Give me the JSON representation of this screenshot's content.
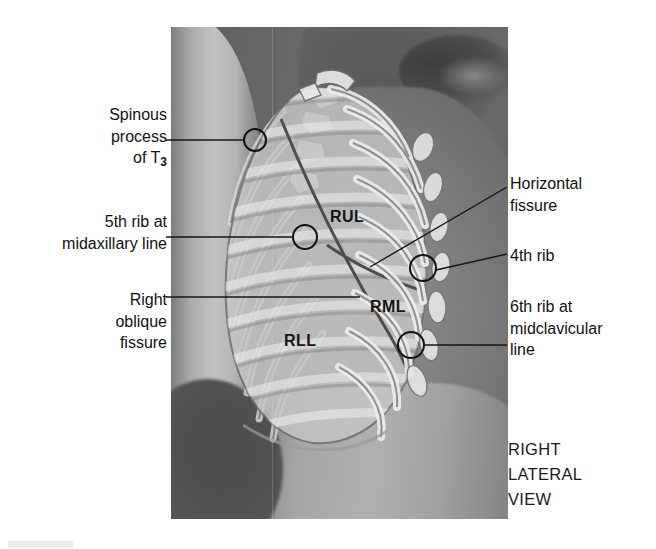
{
  "figure": {
    "view_caption": [
      "RIGHT",
      "LATERAL",
      "VIEW"
    ],
    "colors": {
      "label_text": "#111111",
      "leader_line": "#1a1a1a",
      "marker_circle": "#111111",
      "lung_overlay": "#c8c8c8",
      "rib_overlay": "#e2e2e2",
      "plate_background": "#6e6e6e"
    }
  },
  "lobes": [
    {
      "id": "rul",
      "label": "RUL",
      "name": "right upper lobe"
    },
    {
      "id": "rml",
      "label": "RML",
      "name": "right middle lobe"
    },
    {
      "id": "rll",
      "label": "RLL",
      "name": "right lower lobe"
    }
  ],
  "callouts": {
    "spinous_process": {
      "lines": [
        "Spinous",
        "process",
        "of T"
      ],
      "subscript": "3",
      "side": "left"
    },
    "fifth_rib": {
      "lines": [
        "5th rib at",
        "midaxillary line"
      ],
      "side": "left"
    },
    "right_oblique_fissure": {
      "lines": [
        "Right",
        "oblique",
        "fissure"
      ],
      "side": "left"
    },
    "horizontal_fissure": {
      "lines": [
        "Horizontal",
        "fissure"
      ],
      "side": "right"
    },
    "fourth_rib": {
      "lines": [
        "4th rib"
      ],
      "side": "right"
    },
    "sixth_rib": {
      "lines": [
        "6th rib at",
        "midclavicular",
        "line"
      ],
      "side": "right"
    }
  },
  "markers": [
    {
      "id": "spinous-t3",
      "cx": 255,
      "cy": 140,
      "r": 11
    },
    {
      "id": "fifth-rib",
      "cx": 305,
      "cy": 237,
      "r": 12
    },
    {
      "id": "fourth-rib",
      "cx": 423,
      "cy": 268,
      "r": 13
    },
    {
      "id": "sixth-rib",
      "cx": 411,
      "cy": 345,
      "r": 13
    }
  ]
}
